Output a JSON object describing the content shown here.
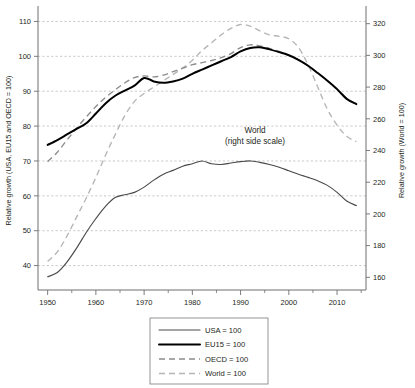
{
  "chart_data": {
    "type": "line",
    "title": "",
    "subtitle": "",
    "xlabel": "Year",
    "ylabel": "Relative growth (USA, EU15 and OECD = 100)",
    "ylabel_right": "Relative growth (World = 100)",
    "xlim": [
      1948,
      2016
    ],
    "ylim": [
      33,
      113
    ],
    "ylim_right": [
      152,
      328
    ],
    "grid": true,
    "legend_position": "bottom-center",
    "annotations": [
      {
        "text_line1": "World",
        "text_line2": "(right side scale)",
        "x": 1993,
        "y": 78
      }
    ],
    "xticks": [
      1950,
      1960,
      1970,
      1980,
      1990,
      2000,
      2010
    ],
    "xticklabels": [
      "1950",
      "1960",
      "1970",
      "1980",
      "1990",
      "2000",
      "2010"
    ],
    "xticks_minor": [
      1955,
      1965,
      1975,
      1985,
      1995,
      2005,
      2015
    ],
    "yticks": [
      40,
      50,
      60,
      70,
      80,
      90,
      100,
      110
    ],
    "yticklabels": [
      "40",
      "50",
      "60",
      "70",
      "80",
      "90",
      "100",
      "110"
    ],
    "yticks_right": [
      160,
      180,
      200,
      220,
      240,
      260,
      280,
      300,
      320
    ],
    "yticklabels_right": [
      "160",
      "180",
      "200",
      "220",
      "240",
      "260",
      "280",
      "300",
      "320"
    ],
    "x": [
      1950,
      1952,
      1954,
      1956,
      1958,
      1960,
      1962,
      1964,
      1966,
      1968,
      1970,
      1972,
      1974,
      1976,
      1978,
      1980,
      1982,
      1984,
      1986,
      1988,
      1990,
      1992,
      1994,
      1996,
      1998,
      2000,
      2002,
      2004,
      2006,
      2008,
      2010,
      2012,
      2014
    ],
    "series": [
      {
        "name": "USA = 100",
        "axis": "left",
        "style": "solid-thin",
        "color": "#4a4a4a",
        "values": [
          36.8,
          38.0,
          41.0,
          45.0,
          49.5,
          53.5,
          57.0,
          59.5,
          60.3,
          61.0,
          62.5,
          64.5,
          66.2,
          67.3,
          68.5,
          69.2,
          70.0,
          69.2,
          69.0,
          69.4,
          69.8,
          70.0,
          69.6,
          69.0,
          68.2,
          67.2,
          66.2,
          65.3,
          64.3,
          63.0,
          61.0,
          58.5,
          57.2
        ]
      },
      {
        "name": "EU15 = 100",
        "axis": "left",
        "style": "solid-thick",
        "color": "#000000",
        "values": [
          74.6,
          76.0,
          77.6,
          79.2,
          80.8,
          83.6,
          86.5,
          88.7,
          90.2,
          91.6,
          93.8,
          92.8,
          92.4,
          92.8,
          93.6,
          95.0,
          96.2,
          97.4,
          98.6,
          99.8,
          101.4,
          102.4,
          102.6,
          102.0,
          101.2,
          100.3,
          99.0,
          97.3,
          95.2,
          93.0,
          90.6,
          87.8,
          86.3
        ]
      },
      {
        "name": "OECD = 100",
        "axis": "left",
        "style": "dashed",
        "color": "#8c8c8c",
        "values": [
          69.8,
          72.5,
          76.0,
          79.4,
          82.6,
          85.6,
          88.2,
          90.4,
          92.4,
          93.9,
          94.4,
          94.1,
          94.6,
          95.6,
          96.6,
          97.6,
          98.2,
          98.8,
          99.6,
          100.8,
          102.5,
          103.3,
          103.0,
          102.3,
          101.4,
          100.3,
          99.0,
          97.3,
          95.3,
          93.0,
          90.6,
          88.0,
          86.3
        ]
      },
      {
        "name": "World = 100",
        "axis": "right",
        "style": "dashed-light",
        "color": "#b5b5b5",
        "values_right": [
          170.0,
          176.0,
          186.0,
          198.0,
          210.0,
          223.0,
          237.0,
          250.0,
          262.0,
          271.0,
          276.0,
          280.0,
          284.0,
          288.0,
          292.0,
          297.0,
          303.0,
          308.0,
          313.0,
          317.0,
          319.5,
          318.5,
          315.5,
          313.0,
          312.0,
          310.5,
          305.0,
          294.0,
          280.0,
          266.0,
          256.0,
          249.0,
          245.5
        ]
      }
    ],
    "legend": [
      {
        "label": "USA = 100",
        "style": "solid-thin",
        "color": "#4a4a4a"
      },
      {
        "label": "EU15 = 100",
        "style": "solid-thick",
        "color": "#000000"
      },
      {
        "label": "OECD = 100",
        "style": "dashed",
        "color": "#8c8c8c"
      },
      {
        "label": "World = 100",
        "style": "dashed-light",
        "color": "#b5b5b5"
      }
    ]
  }
}
